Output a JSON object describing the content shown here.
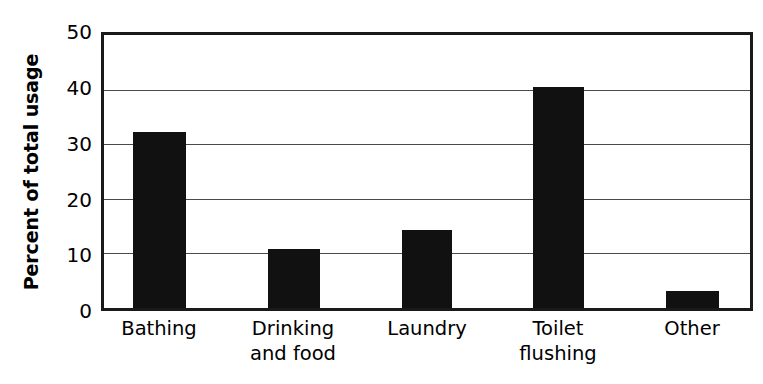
{
  "chart_data": {
    "type": "bar",
    "title": "",
    "subtitle": "",
    "xlabel": "",
    "ylabel": "Percent of total usage",
    "categories": [
      "Bathing",
      "Drinking\nand food",
      "Laundry",
      "Toilet\nflushing",
      "Other"
    ],
    "values": [
      32.3,
      10.8,
      14.3,
      40.5,
      3.2
    ],
    "ylim": [
      0,
      50
    ],
    "ytick_labels": [
      "50",
      "40",
      "30",
      "20",
      "10",
      "0"
    ],
    "ytick_values": [
      50,
      40,
      30,
      20,
      10,
      0
    ],
    "gridlines_at": [
      40,
      30,
      20,
      10
    ],
    "grid": true,
    "legend": "none",
    "bar_color": "#111111",
    "frame_color": "#1a1a1a",
    "grid_color": "#4a4a4a",
    "background": "#ffffff"
  }
}
